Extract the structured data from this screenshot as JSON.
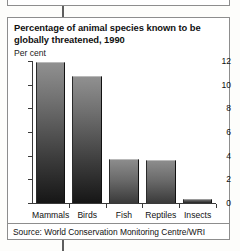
{
  "figure": {
    "title": "Percentage of animal species known to be globally threatened, 1990",
    "unit_label": "Per cent",
    "source": "Source: World Conservation Monitoring Centre/WRI"
  },
  "chart_data": {
    "type": "bar",
    "title": "Percentage of animal species known to be globally threatened, 1990",
    "xlabel": "",
    "ylabel": "Per cent",
    "ylim": [
      0,
      12
    ],
    "yticks": [
      0,
      2,
      4,
      6,
      8,
      10,
      12
    ],
    "ytick_labels": [
      "0",
      "2",
      "4",
      "6",
      "8",
      "10",
      "12"
    ],
    "grid": false,
    "legend": false,
    "categories": [
      "Mammals",
      "Birds",
      "Fish",
      "Reptiles",
      "Insects"
    ],
    "values": [
      11.9,
      10.7,
      3.7,
      3.6,
      0.3
    ],
    "source": "Source: World Conservation Monitoring Centre/WRI"
  },
  "colors": {
    "bar_top": "#909090",
    "bar_bottom": "#161616",
    "axis": "#3a3a3a",
    "frame": "#8d8d8d",
    "text": "#111111",
    "background": "#ffffff"
  }
}
